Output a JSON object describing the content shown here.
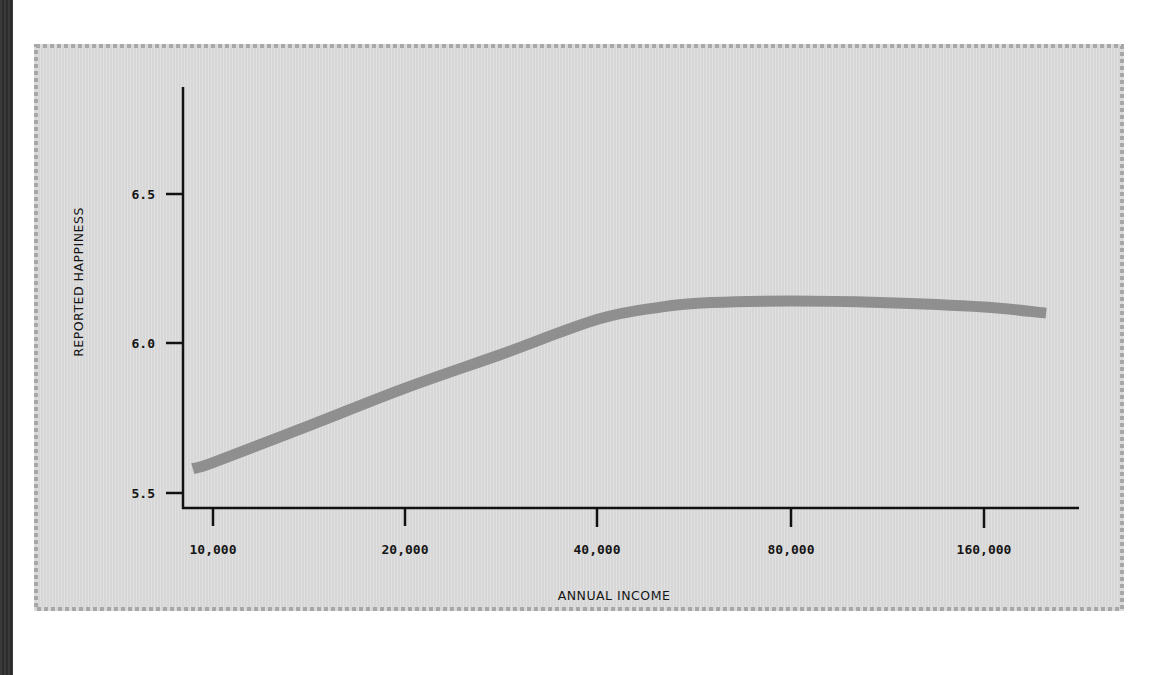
{
  "chart_data": {
    "type": "line",
    "title": "",
    "xlabel": "ANNUAL INCOME",
    "ylabel": "REPORTED HAPPINESS",
    "x_scale": "log2",
    "x_ticks": [
      "10,000",
      "20,000",
      "40,000",
      "80,000",
      "160,000"
    ],
    "x_tick_values": [
      10000,
      20000,
      40000,
      80000,
      160000
    ],
    "y_ticks": [
      "6.5",
      "6.0",
      "5.5"
    ],
    "y_tick_values": [
      6.5,
      6.0,
      5.5
    ],
    "ylim": [
      5.45,
      6.8
    ],
    "grid": false,
    "legend": null,
    "series": [
      {
        "name": "Reported happiness",
        "color": "#8f8f8f",
        "x": [
          9300,
          10000,
          14000,
          20000,
          28000,
          40000,
          50000,
          60000,
          80000,
          110000,
          160000,
          200000
        ],
        "values": [
          5.58,
          5.6,
          5.72,
          5.85,
          5.96,
          6.08,
          6.12,
          6.135,
          6.14,
          6.135,
          6.12,
          6.1
        ]
      }
    ]
  },
  "colors": {
    "panel_background": "#dcdcdc",
    "line": "#8f8f8f",
    "axis": "#111111",
    "border_dots": "#a8a8a8"
  }
}
